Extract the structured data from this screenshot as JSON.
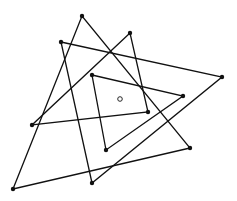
{
  "diagram": {
    "width": 237,
    "height": 201,
    "stroke_color": "#111111",
    "background": "#ffffff",
    "points": {
      "A": [
        82,
        16
      ],
      "B": [
        130,
        33
      ],
      "C": [
        61,
        42
      ],
      "D": [
        222,
        77
      ],
      "E": [
        92,
        75
      ],
      "F": [
        183,
        96
      ],
      "G": [
        148,
        112
      ],
      "H": [
        32,
        125
      ],
      "I": [
        106,
        150
      ],
      "J": [
        190,
        148
      ],
      "K": [
        92,
        183
      ],
      "L": [
        13,
        189
      ]
    },
    "triangles": [
      [
        "L",
        "A",
        "J"
      ],
      [
        "C",
        "D",
        "K"
      ],
      [
        "B",
        "H",
        "G"
      ],
      [
        "E",
        "F",
        "I"
      ]
    ],
    "center": [
      120,
      99
    ]
  }
}
